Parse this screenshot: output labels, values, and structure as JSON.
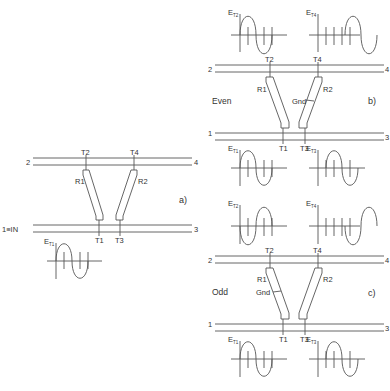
{
  "diagram": {
    "panels": [
      {
        "id": "a",
        "caption": "a)",
        "mode_label": "",
        "port_labels": {
          "p1": "1≡IN",
          "p2": "2",
          "p3": "3",
          "p4": "4"
        },
        "taps": {
          "t1": "T1",
          "t2": "T2",
          "t3": "T3",
          "t4": "T4"
        },
        "resistors": {
          "r1": "R1",
          "r2": "R2"
        },
        "gnd": "",
        "waveforms": [
          {
            "label": "E",
            "sub": "T1",
            "type": "sine-with-ticks"
          }
        ]
      },
      {
        "id": "b",
        "caption": "b)",
        "mode_label": "Even",
        "port_labels": {
          "p1": "1",
          "p2": "2",
          "p3": "3",
          "p4": "4"
        },
        "taps": {
          "t1": "T1",
          "t2": "T2",
          "t3": "T3",
          "t4": "T4"
        },
        "resistors": {
          "r1": "R1",
          "r2": "R2"
        },
        "gnd": "Gnd",
        "waveforms": [
          {
            "label": "E",
            "sub": "T2",
            "type": "sine-with-ticks"
          },
          {
            "label": "E",
            "sub": "T4",
            "type": "delayed-sine"
          },
          {
            "label": "E",
            "sub": "T1",
            "type": "sine-with-ticks"
          },
          {
            "label": "E",
            "sub": "T3",
            "type": "sine-with-ticks"
          }
        ]
      },
      {
        "id": "c",
        "caption": "c)",
        "mode_label": "Odd",
        "port_labels": {
          "p1": "1",
          "p2": "2",
          "p3": "3",
          "p4": "4"
        },
        "taps": {
          "t1": "T1",
          "t2": "T2",
          "t3": "T3",
          "t4": "T4"
        },
        "resistors": {
          "r1": "R1",
          "r2": "R2"
        },
        "gnd": "Gnd",
        "waveforms": [
          {
            "label": "E",
            "sub": "T2",
            "type": "inverted-sine-with-ticks"
          },
          {
            "label": "E",
            "sub": "T4",
            "type": "delayed-sine"
          },
          {
            "label": "E",
            "sub": "T1",
            "type": "sine-with-ticks"
          },
          {
            "label": "E",
            "sub": "T3",
            "type": "sine-with-ticks"
          }
        ]
      }
    ]
  }
}
